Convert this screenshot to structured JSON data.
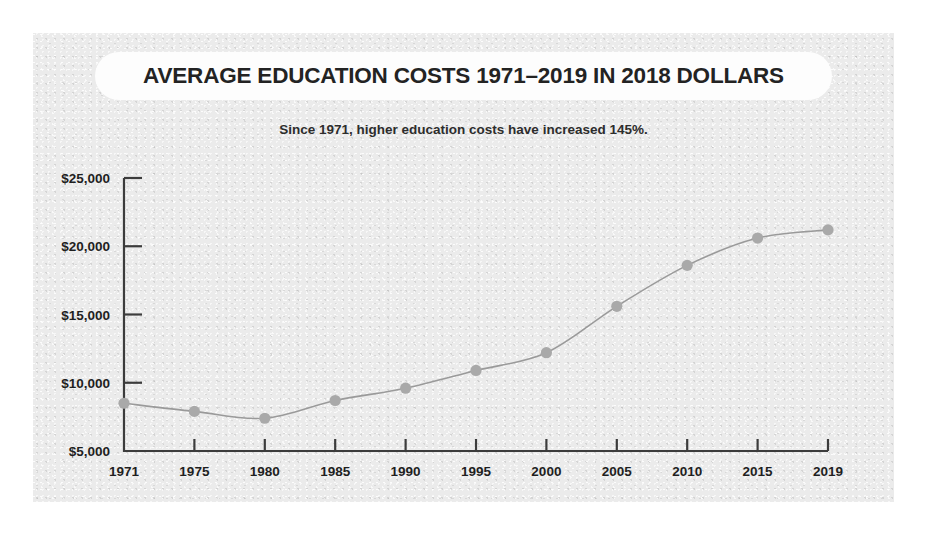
{
  "figure": {
    "background_color": "#ffffff",
    "panel_color": "#ebebeb",
    "title_pill_color": "#fdfdfd"
  },
  "chart_data": {
    "type": "line",
    "title": "AVERAGE EDUCATION COSTS 1971–2019 IN 2018 DOLLARS",
    "subtitle": "Since 1971, higher education costs have increased 145%.",
    "xlabel": "",
    "ylabel": "",
    "x": [
      1971,
      1975,
      1980,
      1985,
      1990,
      1995,
      2000,
      2005,
      2010,
      2015,
      2019
    ],
    "categories": [
      "1971",
      "1975",
      "1980",
      "1985",
      "1990",
      "1995",
      "2000",
      "2005",
      "2010",
      "2015",
      "2019"
    ],
    "values": [
      8500,
      7900,
      7400,
      8700,
      9600,
      10900,
      12200,
      15600,
      18600,
      20600,
      21200
    ],
    "ylim": [
      5000,
      25000
    ],
    "yticks": [
      5000,
      10000,
      15000,
      20000,
      25000
    ],
    "ytick_labels": [
      "$5,000",
      "$10,000",
      "$15,000",
      "$20,000",
      "$25,000"
    ],
    "xtick_labels": [
      "1971",
      "1975",
      "1980",
      "1985",
      "1990",
      "1995",
      "2000",
      "2005",
      "2010",
      "2015",
      "2019"
    ],
    "grid": false,
    "legend": false,
    "legend_position": "none",
    "line_color": "#9a9a9a",
    "marker_color": "#a9a9a9",
    "marker_shape": "circle",
    "axis_color": "#3c3c3c",
    "text_color": "#1f1f1f"
  }
}
